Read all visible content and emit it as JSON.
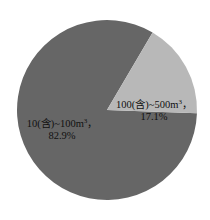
{
  "chart_data": {
    "type": "pie",
    "title": "",
    "subtitle": "",
    "xlabel": "",
    "ylabel": "",
    "legend": "none",
    "grid": false,
    "labels_inside": true,
    "categories": [
      "10(含)~100m³",
      "100(含)~500m³"
    ],
    "values": [
      82.9,
      17.1
    ],
    "value_unit": "%",
    "colors": [
      "#666666",
      "#b8b8b8"
    ],
    "background_color": "#ffffff",
    "start_angle_deg": 2,
    "direction": "clockwise",
    "center": {
      "x": 107,
      "y": 110
    },
    "radius": 90,
    "slices": [
      {
        "name": "10(含)~100m³",
        "value": 82.9,
        "percent_text": "82.9%",
        "color": "#666666",
        "label_line1_pre": "10(含)~100m",
        "label_line1_sup": "3",
        "label_line1_post": "，",
        "label_line2": "82.9%"
      },
      {
        "name": "100(含)~500m³",
        "value": 17.1,
        "percent_text": "17.1%",
        "color": "#b8b8b8",
        "label_line1_pre": "100(含)~500m",
        "label_line1_sup": "3",
        "label_line1_post": "，",
        "label_line2": "17.1%"
      }
    ]
  }
}
